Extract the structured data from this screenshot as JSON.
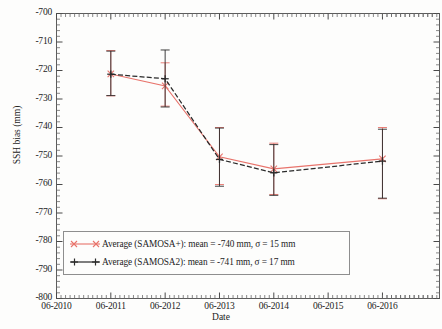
{
  "chart_data": {
    "type": "line",
    "title": "",
    "xlabel": "Date",
    "ylabel": "SSH bias (mm)",
    "ylim": [
      -800,
      -700
    ],
    "ytick_labels": [
      "-700",
      "-710",
      "-720",
      "-730",
      "-740",
      "-750",
      "-760",
      "-770",
      "-780",
      "-790",
      "-800"
    ],
    "ytick_values": [
      -700,
      -710,
      -720,
      -730,
      -740,
      -750,
      -760,
      -770,
      -780,
      -790,
      -800
    ],
    "xtick_labels": [
      "06-2010",
      "06-2011",
      "06-2012",
      "06-2013",
      "06-2014",
      "06-2015",
      "06-2016"
    ],
    "xtick_values": [
      2010.45,
      2011.45,
      2012.45,
      2013.45,
      2014.45,
      2015.45,
      2016.45
    ],
    "xlim": [
      2010.45,
      2017.5
    ],
    "grid": false,
    "legend_position": "lower left",
    "x": [
      2011.45,
      2012.45,
      2013.45,
      2014.45,
      2016.45
    ],
    "series": [
      {
        "name": "Average (SAMOSA+): mean = -740 mm, σ = 15 mm",
        "short_name": "SAMOSA+",
        "color": "#e8736b",
        "marker": "x",
        "values": [
          -721.2,
          -725.4,
          -750.3,
          -754.5,
          -751.0
        ],
        "err_low": [
          -728.9,
          -732.5,
          -760.0,
          -763.5,
          -765.0
        ],
        "err_high": [
          -713.0,
          -717.3,
          -740.0,
          -745.5,
          -740.0
        ]
      },
      {
        "name": "Average (SAMOSA2): mean = -741 mm, σ = 17 mm",
        "short_name": "SAMOSA2",
        "color": "#2a2a2a",
        "marker": "+",
        "values": [
          -721.3,
          -722.9,
          -751.2,
          -755.9,
          -751.8
        ],
        "err_low": [
          -728.8,
          -732.8,
          -760.6,
          -763.8,
          -764.8
        ],
        "err_high": [
          -713.2,
          -712.8,
          -740.2,
          -746.0,
          -740.6
        ]
      }
    ]
  },
  "legend": {
    "entries": [
      {
        "label": "Average (SAMOSA+): mean = -740 mm, σ = 15 mm"
      },
      {
        "label": "Average (SAMOSA2): mean = -741 mm, σ = 17 mm"
      }
    ]
  },
  "axes": {
    "ylabel": "SSH bias (mm)",
    "xlabel": "Date"
  }
}
